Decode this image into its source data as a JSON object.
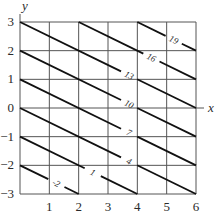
{
  "chart_data": {
    "type": "contour",
    "title": "",
    "xlabel": "x",
    "ylabel": "y",
    "xlim": [
      0,
      6
    ],
    "ylim": [
      -3,
      3
    ],
    "x_ticks": [
      1,
      2,
      3,
      4,
      5,
      6
    ],
    "y_ticks": [
      3,
      2,
      1,
      0,
      -1,
      -2,
      -3
    ],
    "grid": true,
    "function_description": "Level curves of z = 1.5x + 3y + 4 (lines x + 2y = const)",
    "levels": [
      {
        "label": "-5",
        "value": -5,
        "x_plus_2y": -6
      },
      {
        "label": "-2",
        "value": -2,
        "x_plus_2y": -4
      },
      {
        "label": "1",
        "value": 1,
        "x_plus_2y": -2
      },
      {
        "label": "4",
        "value": 4,
        "x_plus_2y": 0
      },
      {
        "label": "7",
        "value": 7,
        "x_plus_2y": 2
      },
      {
        "label": "10",
        "value": 10,
        "x_plus_2y": 4
      },
      {
        "label": "13",
        "value": 13,
        "x_plus_2y": 6
      },
      {
        "label": "16",
        "value": 16,
        "x_plus_2y": 8
      },
      {
        "label": "19",
        "value": 19,
        "x_plus_2y": 10
      }
    ],
    "extra_lines_unlabeled": [
      -10,
      -8,
      -6,
      -4,
      -2,
      0,
      2,
      4,
      6,
      8,
      10
    ]
  },
  "colors": {
    "grid": "#555555",
    "level_line": "#111111",
    "text": "#2a2a2a"
  }
}
